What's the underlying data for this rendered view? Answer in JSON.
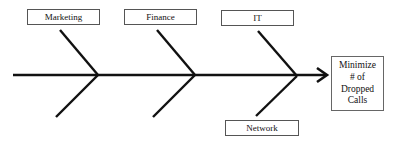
{
  "diagram": {
    "type": "fishbone",
    "causes": [
      {
        "label": "Marketing",
        "position": "top"
      },
      {
        "label": "Finance",
        "position": "top"
      },
      {
        "label": "IT",
        "position": "top"
      },
      {
        "label": "Network",
        "position": "bottom"
      }
    ],
    "effect": {
      "lines": [
        "Minimize",
        "# of",
        "Dropped",
        "Calls"
      ]
    },
    "colors": {
      "line": "#111111",
      "box_border": "#555555",
      "background": "#ffffff"
    }
  }
}
